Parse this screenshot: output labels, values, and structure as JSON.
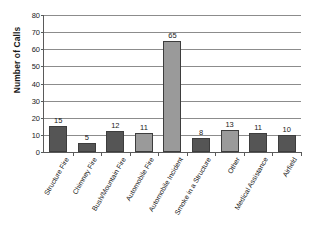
{
  "chart_data": {
    "type": "bar",
    "title": "",
    "xlabel": "",
    "ylabel": "Number of Calls",
    "categories": [
      "Structure Fire",
      "Chimney Fire",
      "Bush/Mountain Fire",
      "Automobile Fire",
      "Automobile Incident",
      "Smoke in a Structure",
      "Other",
      "Medical Assistance",
      "Airfield"
    ],
    "values": [
      15,
      5,
      12,
      11,
      65,
      8,
      13,
      11,
      10
    ],
    "ylim": [
      0,
      80
    ],
    "ytick_step": 10,
    "yticks": [
      0,
      10,
      20,
      30,
      40,
      50,
      60,
      70,
      80
    ],
    "ytick_labels": [
      "0",
      "10",
      "20",
      "30",
      "40",
      "50",
      "60",
      "70",
      "80"
    ],
    "grid": true,
    "grid_axis": "y",
    "legend": false,
    "data_labels": true,
    "bar_colors": [
      "#555555",
      "#555555",
      "#555555",
      "#9a9a9a",
      "#9a9a9a",
      "#555555",
      "#9a9a9a",
      "#555555",
      "#555555"
    ],
    "bar_border_color": "#3d3d3d",
    "axis_color": "#5a5a5a",
    "grid_color": "#8c8c8c",
    "text_color": "#1a1a1a",
    "background": "#ffffff"
  }
}
